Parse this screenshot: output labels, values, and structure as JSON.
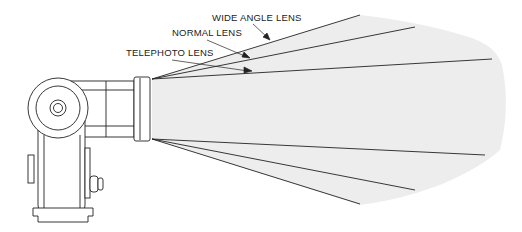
{
  "diagram": {
    "labels": {
      "wide": "WIDE ANGLE LENS",
      "normal": "NORMAL LENS",
      "telephoto": "TELEPHOTO LENS"
    },
    "colors": {
      "beam_fill": "#ededed",
      "line": "#222222",
      "background": "#ffffff"
    }
  }
}
